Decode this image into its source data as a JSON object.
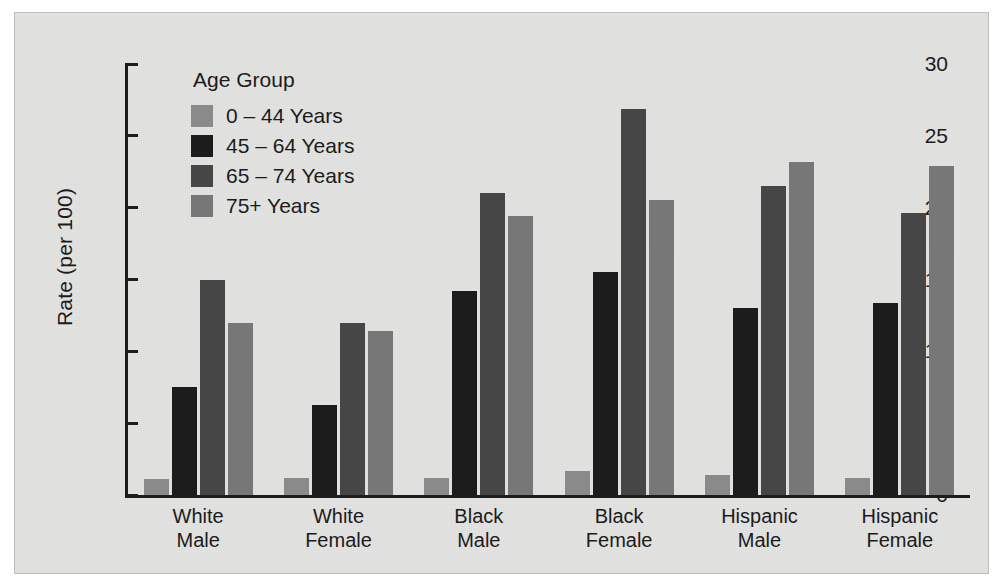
{
  "chart_data": {
    "type": "bar",
    "title": "",
    "xlabel": "",
    "ylabel": "Rate (per 100)",
    "ylim": [
      0,
      30
    ],
    "yticks": [
      0,
      5,
      10,
      15,
      20,
      25,
      30
    ],
    "ytick_labels": [
      "0",
      "5",
      "10",
      "15",
      "20",
      "25",
      "30"
    ],
    "grid": false,
    "legend_title": "Age Group",
    "legend_position": "upper-left-inside",
    "categories": [
      "White\nMale",
      "White\nFemale",
      "Black\nMale",
      "Black\nFemale",
      "Hispanic\nMale",
      "Hispanic\nFemale"
    ],
    "category_lines": [
      [
        "White",
        "Male"
      ],
      [
        "White",
        "Female"
      ],
      [
        "Black",
        "Male"
      ],
      [
        "Black",
        "Female"
      ],
      [
        "Hispanic",
        "Male"
      ],
      [
        "Hispanic",
        "Female"
      ]
    ],
    "series": [
      {
        "name": "0 – 44 Years",
        "color": "#8a8a8a",
        "values": [
          1.1,
          1.2,
          1.2,
          1.7,
          1.4,
          1.2
        ]
      },
      {
        "name": "45 – 64 Years",
        "color": "#1c1c1c",
        "values": [
          7.5,
          6.3,
          14.2,
          15.5,
          13.0,
          13.4
        ]
      },
      {
        "name": "65 – 74 Years",
        "color": "#464646",
        "values": [
          15.0,
          12.0,
          21.0,
          26.9,
          21.5,
          19.6
        ]
      },
      {
        "name": "75+ Years",
        "color": "#777777",
        "values": [
          12.0,
          11.4,
          19.4,
          20.5,
          23.2,
          22.9
        ]
      }
    ]
  },
  "figure": {
    "background": "#e3e3e1",
    "axis_color": "#1d1d1d",
    "text_color": "#1b1b1b"
  }
}
